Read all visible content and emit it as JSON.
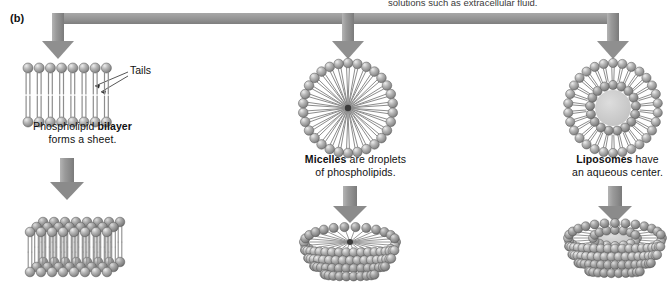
{
  "figure": {
    "panel_tag": "(b)",
    "top_caption": "solutions such as extracellular fluid.",
    "callout_tails": "Tails"
  },
  "branches": [
    {
      "id": "bilayer",
      "caption_line1_prefix": "Phospholipid ",
      "caption_line1_bold": "bilayer",
      "caption_line2": "forms a sheet.",
      "structure_top": "phospholipid-bilayer-sheet-cross-section",
      "structure_bottom": "phospholipid-bilayer-sheet-3d"
    },
    {
      "id": "micelle",
      "caption_line1_bold": "Micelles",
      "caption_line1_suffix": " are droplets",
      "caption_line2": "of phospholipids.",
      "structure_top": "micelle-cross-section",
      "structure_bottom": "micelle-3d"
    },
    {
      "id": "liposome",
      "caption_line1_bold": "Liposomes",
      "caption_line1_suffix": " have",
      "caption_line2": "an aqueous center.",
      "structure_top": "liposome-cross-section",
      "structure_bottom": "liposome-3d"
    }
  ],
  "colors": {
    "arrow_gray": "#8c8c8c",
    "arrow_gray_dark": "#6f6f6f",
    "head_gray": "#9a9a9a",
    "head_highlight": "#e2e2e2",
    "head_edge": "#5f5f5f",
    "tail_gray": "#8a8a8a",
    "aqueous_center": "#cccccc",
    "background": "#ffffff",
    "text": "#111111"
  },
  "geometry": {
    "bus_y": 18,
    "bus_left": 58,
    "bus_right": 613,
    "branch_x": [
      58,
      348,
      613
    ],
    "row1_center_y": 95,
    "row2_center_y": 248
  }
}
